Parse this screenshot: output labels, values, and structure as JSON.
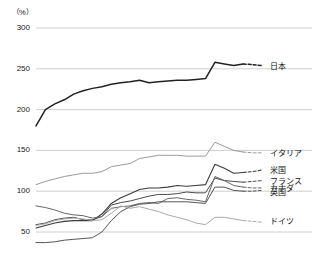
{
  "unit": "（%）",
  "chart_data": {
    "type": "line",
    "title": "",
    "subtitle": "",
    "xlabel": "",
    "ylabel": "（%）",
    "ylim": [
      50,
      300
    ],
    "yticks": [
      50,
      100,
      150,
      200,
      250,
      300
    ],
    "ytick_labels": [
      "50",
      "100",
      "150",
      "200",
      "250",
      "300"
    ],
    "grid": true,
    "legend_position": "right-inline",
    "x": [
      2001,
      2002,
      2003,
      2004,
      2005,
      2006,
      2007,
      2008,
      2009,
      2010,
      2011,
      2012,
      2013,
      2014,
      2015,
      2016,
      2017,
      2018,
      2019,
      2020,
      2021,
      2022,
      2023,
      2024,
      2025
    ],
    "xlim": [
      2001,
      2025
    ],
    "forecast_starts_at": 2023,
    "series": [
      {
        "name": "日本",
        "label": "日本",
        "color": "#222222",
        "width": 1.5,
        "values": [
          180,
          200,
          207,
          212,
          219,
          223,
          226,
          228,
          231,
          233,
          234,
          236,
          233,
          234,
          235,
          236,
          236,
          237,
          238,
          258,
          256,
          254,
          256,
          255,
          254
        ],
        "label_y": 254
      },
      {
        "name": "イタリア",
        "label": "イタリア",
        "color": "#9a9a9a",
        "width": 1.0,
        "values": [
          108,
          112,
          115,
          118,
          120,
          122,
          122,
          124,
          130,
          132,
          134,
          140,
          142,
          144,
          144,
          144,
          143,
          143,
          143,
          160,
          155,
          150,
          148,
          147,
          147
        ],
        "label_y": 147
      },
      {
        "name": "米国",
        "label": "米国",
        "color": "#3a3a3a",
        "width": 1.1,
        "values": [
          55,
          58,
          61,
          63,
          64,
          64,
          64,
          72,
          85,
          92,
          97,
          102,
          104,
          104,
          105,
          107,
          106,
          107,
          108,
          133,
          128,
          122,
          123,
          124,
          126
        ],
        "label_y": 126
      },
      {
        "name": "フランス",
        "label": "フランス",
        "color": "#4a4a4a",
        "width": 1.0,
        "values": [
          59,
          61,
          65,
          67,
          68,
          65,
          65,
          69,
          83,
          86,
          88,
          91,
          94,
          96,
          96,
          97,
          99,
          98,
          98,
          116,
          113,
          112,
          111,
          112,
          113
        ],
        "label_y": 113
      },
      {
        "name": "カナダ",
        "label": "カナダ",
        "color": "#666666",
        "width": 1.0,
        "values": [
          82,
          80,
          77,
          73,
          71,
          70,
          67,
          69,
          79,
          81,
          82,
          85,
          86,
          85,
          91,
          92,
          90,
          89,
          87,
          118,
          113,
          107,
          105,
          104,
          104
        ],
        "label_y": 104
      },
      {
        "name": "英国",
        "label": "英国",
        "color": "#555555",
        "width": 1.0,
        "values": [
          37,
          37,
          38,
          40,
          41,
          42,
          43,
          50,
          64,
          75,
          81,
          84,
          85,
          87,
          87,
          87,
          87,
          86,
          85,
          105,
          105,
          101,
          100,
          100,
          101
        ],
        "label_y": 99
      },
      {
        "name": "ドイツ",
        "label": "ドイツ",
        "color": "#aaaaaa",
        "width": 1.0,
        "values": [
          58,
          60,
          64,
          66,
          67,
          66,
          64,
          65,
          73,
          82,
          79,
          81,
          78,
          75,
          71,
          68,
          65,
          61,
          59,
          68,
          68,
          66,
          64,
          63,
          62
        ],
        "label_y": 64
      }
    ]
  }
}
